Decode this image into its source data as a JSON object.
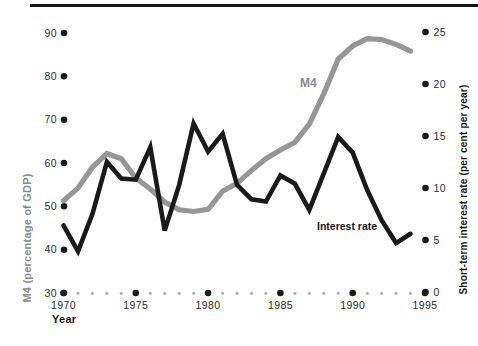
{
  "chart_data": {
    "type": "line",
    "title": "",
    "x": [
      1970,
      1971,
      1972,
      1973,
      1974,
      1975,
      1976,
      1977,
      1978,
      1979,
      1980,
      1981,
      1982,
      1983,
      1984,
      1985,
      1986,
      1987,
      1988,
      1989,
      1990,
      1991,
      1992,
      1993,
      1994
    ],
    "series": [
      {
        "name": "M4",
        "axis": "left",
        "color": "#969696",
        "values": [
          51.3,
          54.2,
          59,
          62.2,
          61,
          56.5,
          54,
          51,
          49.2,
          48.8,
          49.3,
          53.5,
          55.3,
          58.3,
          61,
          63,
          64.8,
          69,
          76,
          84,
          87,
          88.7,
          88.5,
          87.4,
          85.8
        ]
      },
      {
        "name": "Interest rate",
        "axis": "right",
        "color": "#1a1a1a",
        "values": [
          6.4,
          3.9,
          7.5,
          12.5,
          10.9,
          10.8,
          13.9,
          5.9,
          10.3,
          16.2,
          13.5,
          15.2,
          10.3,
          8.9,
          8.7,
          11.2,
          10.4,
          7.9,
          11.4,
          14.9,
          13.4,
          9.8,
          6.9,
          4.7,
          5.6
        ]
      }
    ],
    "left_axis": {
      "title": "M4 (percentage of GDP)",
      "ticks": [
        30,
        40,
        50,
        60,
        70,
        80,
        90
      ],
      "range": [
        30,
        90
      ]
    },
    "right_axis": {
      "title": "Short-term interest rate (per cent per year)",
      "ticks": [
        0,
        5,
        10,
        15,
        20,
        25
      ],
      "range": [
        0,
        25
      ]
    },
    "x_axis": {
      "title": "Year",
      "major_ticks": [
        1970,
        1975,
        1980,
        1985,
        1990,
        1995
      ],
      "minor_ticks": "every year 1971-1994",
      "range": [
        1970,
        1995
      ]
    },
    "legend_position": "inline-labels",
    "grid": "off",
    "colors": {
      "tick_dot_major": "#1a1a1a",
      "tick_dot_minor": "#b3b3b3",
      "top_rule": "#161616"
    }
  }
}
